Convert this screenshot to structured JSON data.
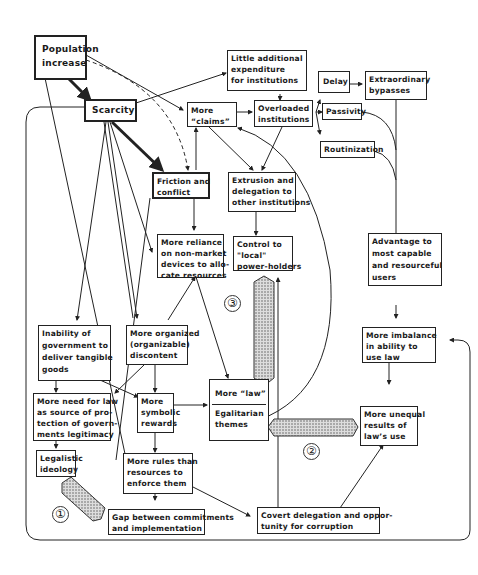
{
  "diagram": {
    "nodes": {
      "population": [
        "Population",
        "increase"
      ],
      "scarcity": [
        "Scarcity"
      ],
      "little_expenditure": [
        "Little additional",
        "expenditure",
        "for institutions"
      ],
      "more_claims": [
        "More",
        "“claims”"
      ],
      "overloaded": [
        "Overloaded",
        "institutions"
      ],
      "delay": [
        "Delay"
      ],
      "extraordinary": [
        "Extraordinary",
        "bypasses"
      ],
      "passivity": [
        "Passivity"
      ],
      "routinization": [
        "Routinization"
      ],
      "friction": [
        "Friction and",
        "conflict"
      ],
      "extrusion": [
        "Extrusion and",
        "delegation to",
        "other institutions"
      ],
      "reliance": [
        "More reliance",
        "on non-market",
        "devices to allo-",
        "cate resources"
      ],
      "control": [
        "Control to",
        "\"local\"",
        "power-holders"
      ],
      "advantage": [
        "Advantage to",
        "most capable",
        "and resourceful",
        "users"
      ],
      "inability": [
        "Inability of",
        "government to",
        "deliver tangible",
        "goods"
      ],
      "organized": [
        "More organized",
        "(organizable)",
        "discontent"
      ],
      "imbalance": [
        "More imbalance",
        "in ability to",
        "use law"
      ],
      "need_law": [
        "More need for law",
        "as source of pro-",
        "tection of govern-",
        "ments legitimacy"
      ],
      "symbolic": [
        "More",
        "symbolic",
        "rewards"
      ],
      "more_law": [
        "More “law”"
      ],
      "egalitarian": [
        "Egalitarian",
        "themes"
      ],
      "unequal": [
        "More unequal",
        "results of",
        "law’s use"
      ],
      "legalistic": [
        "Legalistic",
        "ideology"
      ],
      "rules": [
        "More rules than",
        "resources to",
        "enforce them"
      ],
      "gap": [
        "Gap between commitments",
        "and implementation"
      ],
      "covert": [
        "Covert delegation and oppor-",
        "tunity for corruption"
      ]
    },
    "markers": {
      "one": "①",
      "two": "②",
      "three": "③"
    },
    "colors": {
      "ink": "#222222",
      "background": "#ffffff",
      "hatch": "#9a9a9a"
    }
  }
}
